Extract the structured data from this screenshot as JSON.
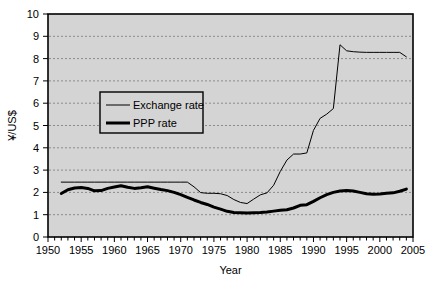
{
  "chart_data": {
    "type": "line",
    "title": "",
    "xlabel": "Year",
    "ylabel": "¥/US$",
    "xlim": [
      1950,
      2005
    ],
    "ylim": [
      0,
      10
    ],
    "ytick_step": 1,
    "xtick_step": 1,
    "xlabel_step": 5,
    "grid": "horizontal-dashed",
    "plot_background": "#d4d4d4",
    "legend_position": "upper-left-inside",
    "yticks": [
      0,
      1,
      2,
      3,
      4,
      5,
      6,
      7,
      8,
      9,
      10
    ],
    "xticks": [
      1950,
      1955,
      1960,
      1965,
      1970,
      1975,
      1980,
      1985,
      1990,
      1995,
      2000,
      2005
    ],
    "series": [
      {
        "name": "Exchange rate",
        "color": "#000000",
        "width": 1,
        "x": [
          1952,
          1953,
          1954,
          1955,
          1956,
          1957,
          1958,
          1959,
          1960,
          1961,
          1962,
          1963,
          1964,
          1965,
          1966,
          1967,
          1968,
          1969,
          1970,
          1971,
          1972,
          1973,
          1974,
          1975,
          1976,
          1977,
          1978,
          1979,
          1980,
          1981,
          1982,
          1983,
          1984,
          1985,
          1986,
          1987,
          1988,
          1989,
          1990,
          1991,
          1992,
          1993,
          1994,
          1995,
          1996,
          1997,
          1998,
          1999,
          2000,
          2001,
          2002,
          2003,
          2004
        ],
        "y": [
          2.46,
          2.46,
          2.46,
          2.46,
          2.46,
          2.46,
          2.46,
          2.46,
          2.46,
          2.46,
          2.46,
          2.46,
          2.46,
          2.46,
          2.46,
          2.46,
          2.46,
          2.46,
          2.46,
          2.46,
          2.25,
          1.99,
          1.96,
          1.96,
          1.94,
          1.86,
          1.68,
          1.55,
          1.5,
          1.7,
          1.89,
          1.98,
          2.32,
          2.94,
          3.45,
          3.72,
          3.72,
          3.77,
          4.78,
          5.32,
          5.51,
          5.76,
          8.62,
          8.35,
          8.31,
          8.29,
          8.28,
          8.28,
          8.28,
          8.28,
          8.28,
          8.28,
          8.08
        ]
      },
      {
        "name": "PPP rate",
        "color": "#000000",
        "width": 3,
        "x": [
          1952,
          1953,
          1954,
          1955,
          1956,
          1957,
          1958,
          1959,
          1960,
          1961,
          1962,
          1963,
          1964,
          1965,
          1966,
          1967,
          1968,
          1969,
          1970,
          1971,
          1972,
          1973,
          1974,
          1975,
          1976,
          1977,
          1978,
          1979,
          1980,
          1981,
          1982,
          1983,
          1984,
          1985,
          1986,
          1987,
          1988,
          1989,
          1990,
          1991,
          1992,
          1993,
          1994,
          1995,
          1996,
          1997,
          1998,
          1999,
          2000,
          2001,
          2002,
          2003,
          2004
        ],
        "y": [
          1.95,
          2.12,
          2.2,
          2.22,
          2.18,
          2.07,
          2.08,
          2.18,
          2.24,
          2.3,
          2.23,
          2.18,
          2.21,
          2.25,
          2.19,
          2.13,
          2.08,
          2.0,
          1.9,
          1.78,
          1.66,
          1.55,
          1.46,
          1.34,
          1.25,
          1.15,
          1.1,
          1.09,
          1.08,
          1.09,
          1.1,
          1.12,
          1.16,
          1.2,
          1.22,
          1.3,
          1.42,
          1.45,
          1.6,
          1.76,
          1.9,
          2.0,
          2.06,
          2.08,
          2.06,
          2.0,
          1.94,
          1.92,
          1.93,
          1.96,
          1.98,
          2.05,
          2.15
        ]
      }
    ],
    "legend": [
      {
        "label": "Exchange rate",
        "width": 1
      },
      {
        "label": "PPP rate",
        "width": 3
      }
    ]
  }
}
